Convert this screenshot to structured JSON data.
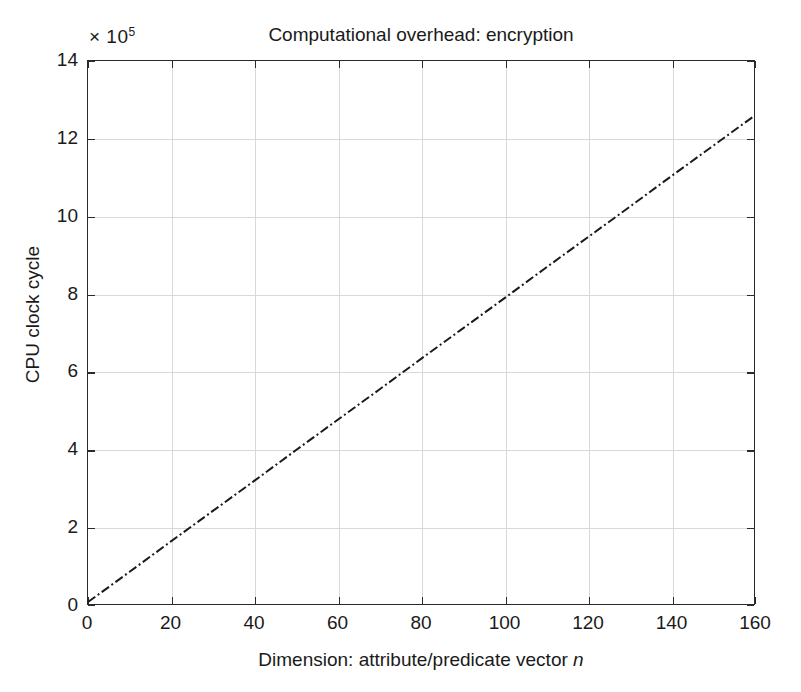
{
  "chart_data": {
    "type": "line",
    "title": "Computational overhead: encryption",
    "xlabel_prefix": "Dimension: attribute/predicate vector ",
    "xlabel_var": "n",
    "ylabel": "CPU clock cycle",
    "y_multiplier_times": "× 10",
    "y_multiplier_exponent": "5",
    "xlim": [
      0,
      160
    ],
    "ylim": [
      0,
      14
    ],
    "xticks": [
      0,
      20,
      40,
      60,
      80,
      100,
      120,
      140,
      160
    ],
    "yticks": [
      0,
      2,
      4,
      6,
      8,
      10,
      12,
      14
    ],
    "xticklabels": [
      "0",
      "20",
      "40",
      "60",
      "80",
      "100",
      "120",
      "140",
      "160"
    ],
    "yticklabels": [
      "0",
      "2",
      "4",
      "6",
      "8",
      "10",
      "12",
      "14"
    ],
    "grid": true,
    "legend": "none",
    "series": [
      {
        "name": "encryption",
        "linestyle": "dash-dot",
        "color": "#1a1a1a",
        "linewidth": 2,
        "x": [
          0,
          10,
          20,
          30,
          40,
          50,
          60,
          70,
          80,
          90,
          100,
          110,
          120,
          130,
          140,
          150,
          160
        ],
        "y": [
          0.05,
          0.83,
          1.62,
          2.4,
          3.18,
          3.97,
          4.75,
          5.53,
          6.32,
          7.1,
          7.88,
          8.67,
          9.45,
          10.23,
          11.02,
          11.8,
          12.58
        ]
      }
    ]
  }
}
